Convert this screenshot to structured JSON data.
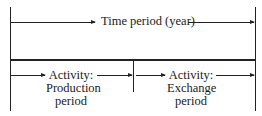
{
  "diagram": {
    "top": {
      "label": "Time period (year)"
    },
    "bottom": [
      {
        "line1": "Activity:",
        "line2": "Production",
        "line3": "period"
      },
      {
        "line1": "Activity:",
        "line2": "Exchange",
        "line3": "period"
      }
    ]
  }
}
